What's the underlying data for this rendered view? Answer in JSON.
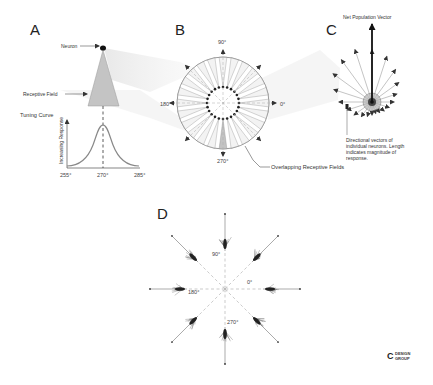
{
  "panels": {
    "A": {
      "letter": "A",
      "neuron_label": "Neuron",
      "receptive_field_label": "Receptive Field",
      "tuning_curve_label": "Tuning Curve",
      "y_axis_label": "Increasing Response",
      "x_ticks": [
        "255°",
        "270°",
        "285°"
      ]
    },
    "B": {
      "letter": "B",
      "angles": {
        "top": "90°",
        "left": "180°",
        "right": "0°",
        "bottom": "270°"
      },
      "callout": "Overlapping Receptive Fields"
    },
    "C": {
      "letter": "C",
      "title": "Net Population Vector",
      "caption_lines": [
        "Directional vectors of",
        "individual neurons. Length",
        "indicates magnitude of",
        "response."
      ]
    },
    "D": {
      "letter": "D",
      "angles": {
        "top": "90°",
        "left": "180°",
        "right": "0°",
        "bottom": "270°"
      }
    }
  },
  "logo": {
    "mark": "C",
    "line1": "DESIGN",
    "line2": "GROUP"
  },
  "colors": {
    "field_fill": "#c8c8c8",
    "line": "#555555",
    "dark": "#222222",
    "shade": "#eeeeee"
  }
}
